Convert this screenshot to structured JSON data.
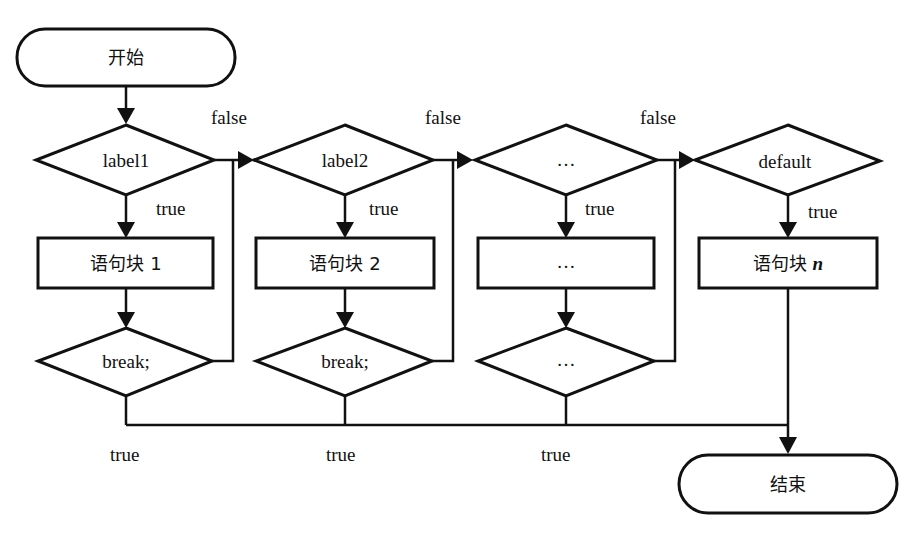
{
  "diagram": {
    "start": {
      "label": "开始"
    },
    "end": {
      "label": "结束"
    },
    "columns": [
      {
        "condition": "label1",
        "true_label": "true",
        "block": "语句块 1",
        "break": "break;",
        "false_label": "false",
        "exit_true": "true"
      },
      {
        "condition": "label2",
        "true_label": "true",
        "block": "语句块 2",
        "break": "break;",
        "false_label": "false",
        "exit_true": "true"
      },
      {
        "condition": "…",
        "true_label": "true",
        "block": "…",
        "break": "…",
        "false_label": "false",
        "exit_true": "true"
      },
      {
        "condition": "default",
        "true_label": "true",
        "block_prefix": "语句块 ",
        "block_var": "n"
      }
    ],
    "colors": {
      "stroke": "#111111",
      "background": "#ffffff"
    }
  }
}
